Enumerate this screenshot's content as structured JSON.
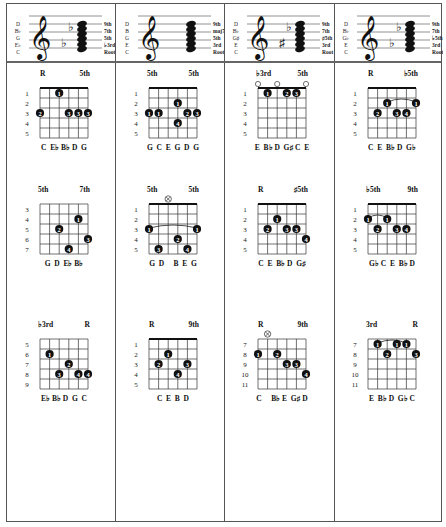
{
  "header_staves": [
    {
      "left_notes": [
        "D",
        "B♭",
        "G",
        "E♭",
        "C"
      ],
      "right_labels": [
        "9th",
        "7th",
        "5th",
        "♭3rd",
        "Root"
      ],
      "accidentals": [
        "♭",
        "♭"
      ]
    },
    {
      "left_notes": [
        "D",
        "B",
        "G",
        "E",
        "C"
      ],
      "right_labels": [
        "9th",
        "maj7th",
        "5th",
        "3rd",
        "Root"
      ],
      "accidentals": []
    },
    {
      "left_notes": [
        "D",
        "B♭",
        "G♯",
        "E",
        "C"
      ],
      "right_labels": [
        "9th",
        "7th",
        "♯5th",
        "3rd",
        "Root"
      ],
      "accidentals": [
        "♯",
        "♭"
      ]
    },
    {
      "left_notes": [
        "D",
        "B♭",
        "G♭",
        "E",
        "C"
      ],
      "right_labels": [
        "9th",
        "7th",
        "♭5th",
        "3rd",
        "Root"
      ],
      "accidentals": [
        "♭",
        "♭"
      ]
    }
  ],
  "diagrams": [
    {
      "id": "c1r1",
      "top_left": "R",
      "top_right": "5th",
      "frets": [
        "1",
        "2",
        "3",
        "4",
        "5"
      ],
      "notes": "C  E♭ B♭ D  G",
      "open": [],
      "mute": [],
      "dots": [
        [
          2,
          1,
          "1"
        ],
        [
          0,
          3,
          "2"
        ],
        [
          3,
          3,
          "3"
        ],
        [
          4,
          3,
          "3"
        ],
        [
          5,
          3,
          "3"
        ]
      ],
      "barre": null,
      "nut": true
    },
    {
      "id": "c2r1",
      "top_left": "5th",
      "top_right": "5th",
      "frets": [
        "1",
        "2",
        "3",
        "4",
        "5"
      ],
      "notes": "G  C  E  G  D  G",
      "open": [],
      "mute": [],
      "dots": [
        [
          3,
          2,
          "1"
        ],
        [
          0,
          3,
          "1"
        ],
        [
          1,
          3,
          "1"
        ],
        [
          4,
          3,
          "2"
        ],
        [
          5,
          3,
          "3"
        ],
        [
          3,
          4,
          "4"
        ]
      ],
      "barre": null,
      "nut": true
    },
    {
      "id": "c3r1",
      "top_left": "♭3rd",
      "top_right": "5th",
      "frets": [
        "1",
        "2",
        "3",
        "4",
        "5"
      ],
      "notes": "E  B♭ D  G♯ C  E",
      "open": [
        0,
        2,
        5
      ],
      "mute": [],
      "dots": [
        [
          1,
          1,
          "1"
        ],
        [
          3,
          1,
          "2"
        ],
        [
          4,
          1,
          "3"
        ]
      ],
      "barre": null,
      "nut": true
    },
    {
      "id": "c4r1",
      "top_left": "R",
      "top_right": "♭5th",
      "frets": [
        "1",
        "2",
        "3",
        "4",
        "5"
      ],
      "notes": "C  E  B♭ D  G♭",
      "open": [],
      "mute": [],
      "dots": [
        [
          2,
          2,
          "1"
        ],
        [
          5,
          2,
          "1"
        ],
        [
          1,
          3,
          "2"
        ],
        [
          3,
          3,
          "3"
        ],
        [
          4,
          3,
          "4"
        ]
      ],
      "barre": [
        2,
        5,
        2
      ],
      "nut": true
    },
    {
      "id": "c1r2",
      "top_left": "5th",
      "top_right": "7th",
      "frets": [
        "3",
        "4",
        "5",
        "6",
        "7"
      ],
      "notes": "G  D  E♭ B♭",
      "open": [],
      "mute": [],
      "dots": [
        [
          4,
          2,
          "1"
        ],
        [
          2,
          3,
          "2"
        ],
        [
          5,
          4,
          "3"
        ],
        [
          3,
          5,
          "4"
        ]
      ],
      "barre": null,
      "nut": false
    },
    {
      "id": "c2r2",
      "top_left": "5th",
      "top_right": "5th",
      "frets": [
        "1",
        "2",
        "3",
        "4",
        "5"
      ],
      "notes": "G  D     B  E  G",
      "open": [],
      "mute": [
        2
      ],
      "dots": [
        [
          0,
          3,
          "1"
        ],
        [
          5,
          3,
          "1"
        ],
        [
          3,
          4,
          "2"
        ],
        [
          1,
          5,
          "3"
        ],
        [
          4,
          5,
          "4"
        ]
      ],
      "barre": [
        0,
        5,
        3
      ],
      "nut": true
    },
    {
      "id": "c3r2",
      "top_left": "R",
      "top_right": "♯5th",
      "frets": [
        "1",
        "2",
        "3",
        "4",
        "5"
      ],
      "notes": "C  E  B♭ D  G♯",
      "open": [],
      "mute": [],
      "dots": [
        [
          2,
          2,
          "1"
        ],
        [
          1,
          3,
          "2"
        ],
        [
          3,
          3,
          "3"
        ],
        [
          4,
          3,
          "3"
        ],
        [
          5,
          4,
          "4"
        ]
      ],
      "barre": null,
      "nut": true
    },
    {
      "id": "c4r2",
      "top_left": "♭5th",
      "top_right": "9th",
      "frets": [
        "1",
        "2",
        "3",
        "4",
        "5"
      ],
      "notes": "G♭ C  E  B♭ D",
      "open": [],
      "mute": [],
      "dots": [
        [
          0,
          2,
          "1"
        ],
        [
          2,
          2,
          "1"
        ],
        [
          1,
          3,
          "2"
        ],
        [
          3,
          3,
          "3"
        ],
        [
          4,
          3,
          "4"
        ]
      ],
      "barre": [
        0,
        2,
        2
      ],
      "nut": true
    },
    {
      "id": "c1r3",
      "top_left": "♭3rd",
      "top_right": "R",
      "frets": [
        "5",
        "6",
        "7",
        "8",
        "9"
      ],
      "notes": "E♭ B♭ D  G  C",
      "open": [],
      "mute": [],
      "dots": [
        [
          1,
          2,
          "1"
        ],
        [
          3,
          3,
          "2"
        ],
        [
          2,
          4,
          "3"
        ],
        [
          4,
          4,
          "4"
        ],
        [
          5,
          4,
          "4"
        ]
      ],
      "barre": null,
      "nut": false
    },
    {
      "id": "c2r3",
      "top_left": "R",
      "top_right": "9th",
      "frets": [
        "1",
        "2",
        "3",
        "4",
        "5"
      ],
      "notes": "C  E  B  D",
      "open": [],
      "mute": [],
      "dots": [
        [
          2,
          2,
          "1"
        ],
        [
          1,
          3,
          "2"
        ],
        [
          4,
          3,
          "3"
        ],
        [
          3,
          4,
          "4"
        ]
      ],
      "barre": null,
      "nut": true
    },
    {
      "id": "c3r3",
      "top_left": "R",
      "top_right": "9th",
      "frets": [
        "7",
        "8",
        "9",
        "10",
        "11"
      ],
      "notes": "C     B♭ E  G♯ D",
      "open": [],
      "mute": [
        1
      ],
      "dots": [
        [
          0,
          2,
          "1"
        ],
        [
          2,
          2,
          "2"
        ],
        [
          3,
          3,
          "3"
        ],
        [
          4,
          3,
          "3"
        ],
        [
          5,
          4,
          "4"
        ]
      ],
      "barre": null,
      "nut": false
    },
    {
      "id": "c4r3",
      "top_left": "3rd",
      "top_right": "R",
      "frets": [
        "7",
        "8",
        "9",
        "10",
        "11"
      ],
      "notes": "E  B♭ D  G♭ C",
      "open": [],
      "mute": [],
      "dots": [
        [
          1,
          1,
          "1"
        ],
        [
          3,
          1,
          "1"
        ],
        [
          4,
          1,
          "1"
        ],
        [
          2,
          2,
          "2"
        ],
        [
          5,
          2,
          "3"
        ]
      ],
      "barre": [
        1,
        4,
        1
      ],
      "nut": false
    }
  ]
}
